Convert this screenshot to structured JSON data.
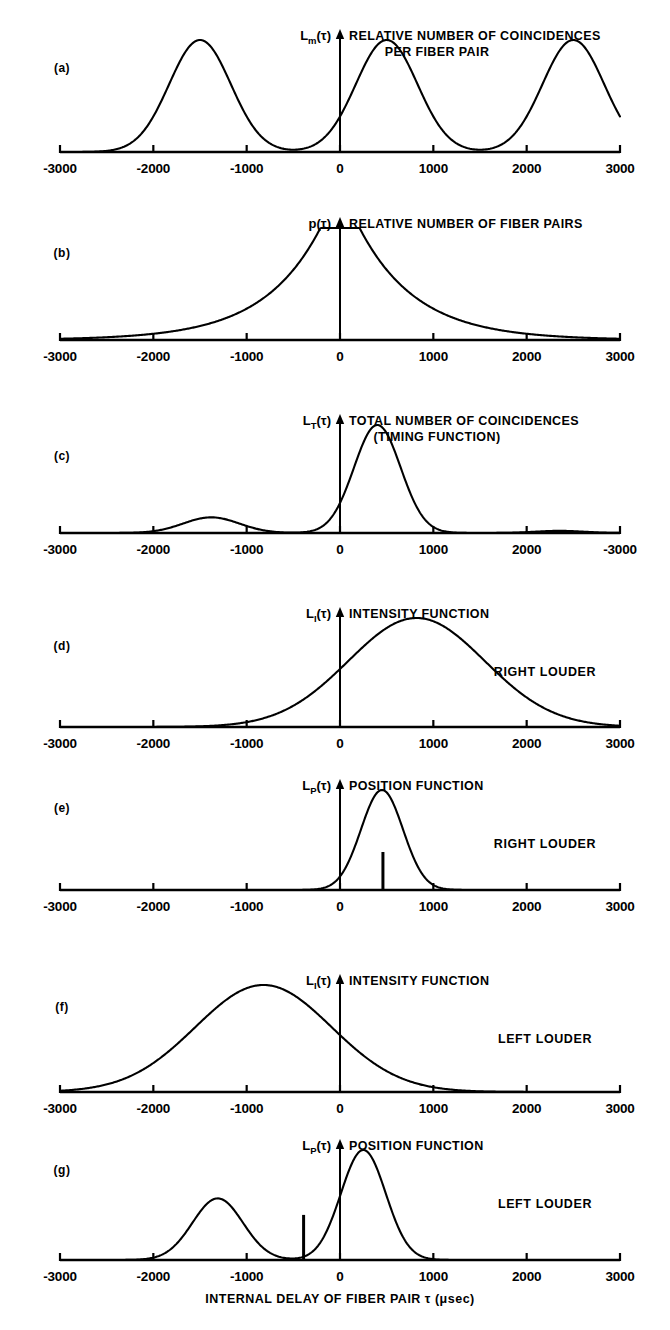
{
  "figure": {
    "xaxis_title": "INTERNAL DELAY OF FIBER PAIR τ (μsec)",
    "axis_color": "#000000",
    "background": "#ffffff"
  },
  "chart_data": [
    {
      "type": "line",
      "panel": "(a)",
      "ylabel": "L",
      "ylabel_sub": "m",
      "ylabel_tail": "(τ)",
      "title": "RELATIVE NUMBER OF COINCIDENCES",
      "title_line2": "PER FIBER PAIR",
      "annotation": "",
      "xlabel": "",
      "xlim": [
        -3000,
        3000
      ],
      "ylim": [
        0,
        1
      ],
      "grid": false,
      "tick_values": [
        -3000,
        -2000,
        -1000,
        0,
        1000,
        2000,
        3000
      ],
      "tick_labels": [
        "-3000",
        "-2000",
        "-1000",
        "0",
        "1000",
        "2000",
        "3000"
      ],
      "curve_kind": "gaussian-sum",
      "peaks": [
        {
          "center": -1500,
          "sigma": 330,
          "height": 1.0
        },
        {
          "center": 500,
          "sigma": 330,
          "height": 1.0
        },
        {
          "center": 2500,
          "sigma": 330,
          "height": 1.0
        }
      ],
      "markers": []
    },
    {
      "type": "line",
      "panel": "(b)",
      "ylabel": "p",
      "ylabel_sub": "",
      "ylabel_tail": "(τ)",
      "title": "RELATIVE NUMBER OF FIBER PAIRS",
      "title_line2": "",
      "annotation": "",
      "xlabel": "",
      "xlim": [
        -3000,
        3000
      ],
      "ylim": [
        0,
        1
      ],
      "grid": false,
      "tick_values": [
        -3000,
        -2000,
        -1000,
        0,
        1000,
        2000,
        3000
      ],
      "tick_labels": [
        "-3000",
        "-2000",
        "-1000",
        "0",
        "1000",
        "2000",
        "3000"
      ],
      "curve_kind": "plateau-exponential",
      "plateau_halfwidth": 210,
      "decay": 620,
      "height": 1.0,
      "markers": []
    },
    {
      "type": "line",
      "panel": "(c)",
      "ylabel": "L",
      "ylabel_sub": "T",
      "ylabel_tail": "(τ)",
      "title": "TOTAL NUMBER OF COINCIDENCES",
      "title_line2": "(TIMING FUNCTION)",
      "annotation": "",
      "xlabel": "",
      "xlim": [
        -3000,
        3000
      ],
      "ylim": [
        0,
        1
      ],
      "grid": false,
      "tick_values": [
        -3000,
        -2000,
        -1000,
        0,
        1000,
        2000,
        3000
      ],
      "tick_labels": [
        "-3000",
        "-2000",
        "-1000",
        "0",
        "1000",
        "2000",
        "-3000"
      ],
      "curve_kind": "gaussian-sum",
      "peaks": [
        {
          "center": 400,
          "sigma": 250,
          "height": 1.0
        },
        {
          "center": -1380,
          "sigma": 300,
          "height": 0.145
        },
        {
          "center": 2350,
          "sigma": 260,
          "height": 0.02
        }
      ],
      "markers": []
    },
    {
      "type": "line",
      "panel": "(d)",
      "ylabel": "L",
      "ylabel_sub": "I",
      "ylabel_tail": "(τ)",
      "title": "INTENSITY  FUNCTION",
      "title_line2": "",
      "annotation": "RIGHT LOUDER",
      "xlabel": "",
      "xlim": [
        -3000,
        3000
      ],
      "ylim": [
        0,
        1
      ],
      "grid": false,
      "tick_values": [
        -3000,
        -2000,
        -1000,
        0,
        1000,
        2000,
        3000
      ],
      "tick_labels": [
        "-3000",
        "-2000",
        "-1000",
        "0",
        "1000",
        "2000",
        "3000"
      ],
      "curve_kind": "gaussian-sum",
      "peaks": [
        {
          "center": 820,
          "sigma": 730,
          "height": 1.0
        }
      ],
      "markers": []
    },
    {
      "type": "line",
      "panel": "(e)",
      "ylabel": "L",
      "ylabel_sub": "P",
      "ylabel_tail": "(τ)",
      "title": "POSITION FUNCTION",
      "title_line2": "",
      "annotation": "RIGHT LOUDER",
      "xlabel": "",
      "xlim": [
        -3000,
        3000
      ],
      "ylim": [
        0,
        1
      ],
      "grid": false,
      "tick_values": [
        -3000,
        -2000,
        -1000,
        0,
        1000,
        2000,
        3000
      ],
      "tick_labels": [
        "-3000",
        "-2000",
        "-1000",
        "0",
        "1000",
        "2000",
        "3000"
      ],
      "curve_kind": "gaussian-sum",
      "peaks": [
        {
          "center": 450,
          "sigma": 225,
          "height": 1.0
        }
      ],
      "markers": [
        {
          "position": 460,
          "height": 0.38
        }
      ]
    },
    {
      "type": "line",
      "panel": "(f)",
      "ylabel": "L",
      "ylabel_sub": "I",
      "ylabel_tail": "(τ)",
      "title": "INTENSITY FUNCTION",
      "title_line2": "",
      "annotation": "LEFT LOUDER",
      "xlabel": "",
      "xlim": [
        -3000,
        3000
      ],
      "ylim": [
        0,
        1
      ],
      "grid": false,
      "tick_values": [
        -3000,
        -2000,
        -1000,
        0,
        1000,
        2000,
        3000
      ],
      "tick_labels": [
        "-3000",
        "-2000",
        "-1000",
        "0",
        "1000",
        "2000",
        "3000"
      ],
      "curve_kind": "gaussian-sum",
      "peaks": [
        {
          "center": -820,
          "sigma": 730,
          "height": 1.0
        }
      ],
      "markers": []
    },
    {
      "type": "line",
      "panel": "(g)",
      "ylabel": "L",
      "ylabel_sub": "P",
      "ylabel_tail": "(τ)",
      "title": "POSITION FUNCTION",
      "title_line2": "",
      "annotation": "LEFT LOUDER",
      "xlabel": "INTERNAL DELAY OF FIBER PAIR τ (μsec)",
      "xlim": [
        -3000,
        3000
      ],
      "ylim": [
        0,
        1
      ],
      "grid": false,
      "tick_values": [
        -3000,
        -2000,
        -1000,
        0,
        1000,
        2000,
        3000
      ],
      "tick_labels": [
        "-3000",
        "-2000",
        "-1000",
        "0",
        "1000",
        "2000",
        "3000"
      ],
      "curve_kind": "gaussian-sum",
      "peaks": [
        {
          "center": 250,
          "sigma": 240,
          "height": 1.0
        },
        {
          "center": -1310,
          "sigma": 270,
          "height": 0.56
        }
      ],
      "markers": [
        {
          "position": -390,
          "height": 0.41
        }
      ]
    }
  ],
  "panel_geometry": [
    {
      "baseline": 152,
      "top": 40,
      "label_y": 72
    },
    {
      "baseline": 340,
      "top": 228,
      "label_y": 257
    },
    {
      "baseline": 533,
      "top": 425,
      "label_y": 460
    },
    {
      "baseline": 727,
      "top": 618,
      "label_y": 650
    },
    {
      "baseline": 890,
      "top": 790,
      "label_y": 812
    },
    {
      "baseline": 1092,
      "top": 985,
      "label_y": 1011
    },
    {
      "baseline": 1260,
      "top": 1150,
      "label_y": 1174
    }
  ]
}
